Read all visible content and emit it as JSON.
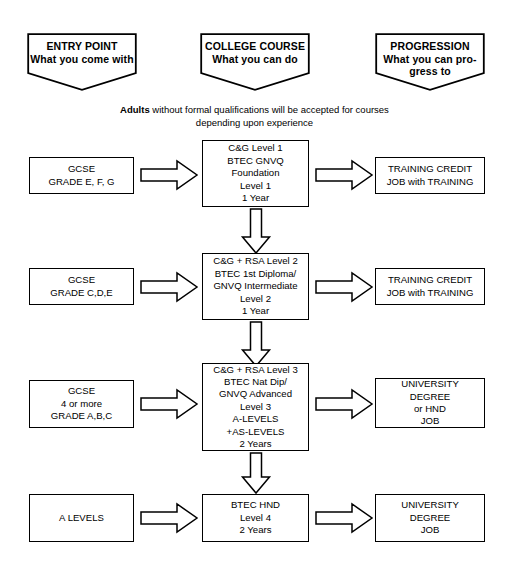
{
  "diagram": {
    "title_columns": [
      {
        "heading": "ENTRY POINT",
        "sub": "What you come with"
      },
      {
        "heading": "COLLEGE COURSE",
        "sub": "What you can do"
      },
      {
        "heading": "PROGRESSION",
        "sub": "What you can pro-\ngress to"
      }
    ],
    "note": {
      "bold_lead": "Adults",
      "rest": " without formal qualifications will be accepted for courses",
      "line2": "depending upon experience"
    },
    "rows": [
      {
        "entry": "GCSE\nGRADE E, F, G",
        "course": "C&G Level 1\nBTEC GNVQ\nFoundation\nLevel 1\n1 Year",
        "progression": "TRAINING CREDIT\nJOB with TRAINING"
      },
      {
        "entry": "GCSE\nGRADE C,D,E",
        "course": "C&G + RSA Level 2\nBTEC 1st Diploma/\nGNVQ Intermediate\nLevel 2\n1 Year",
        "progression": "TRAINING CREDIT\nJOB with TRAINING"
      },
      {
        "entry": "GCSE\n4 or more\nGRADE A,B,C",
        "course": "C&G + RSA Level 3\nBTEC Nat Dip/\nGNVQ Advanced\nLevel 3\nA-LEVELS\n+AS-LEVELS\n2 Years",
        "progression": "UNIVERSITY\nDEGREE\nor HND\nJOB"
      },
      {
        "entry": "A LEVELS",
        "course": "BTEC HND\nLevel 4\n2 Years",
        "progression": "UNIVERSITY\nDEGREE\nJOB"
      }
    ],
    "colors": {
      "stroke": "#000000",
      "fill": "#ffffff",
      "text": "#000000"
    }
  }
}
